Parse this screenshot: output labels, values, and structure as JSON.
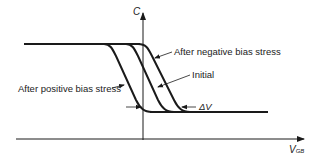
{
  "diagram": {
    "type": "C-V characteristic shift under bias stress",
    "axes": {
      "y_label": "C",
      "x_label_main": "V",
      "x_label_sub": "GB"
    },
    "curves": [
      {
        "id": "positive",
        "label": "After positive bias stress"
      },
      {
        "id": "initial",
        "label": "Initial"
      },
      {
        "id": "negative",
        "label": "After negative bias stress"
      }
    ],
    "annotations": {
      "delta_v": "ΔV"
    },
    "colors": {
      "line": "#1a1a1a",
      "background": "#ffffff"
    }
  }
}
